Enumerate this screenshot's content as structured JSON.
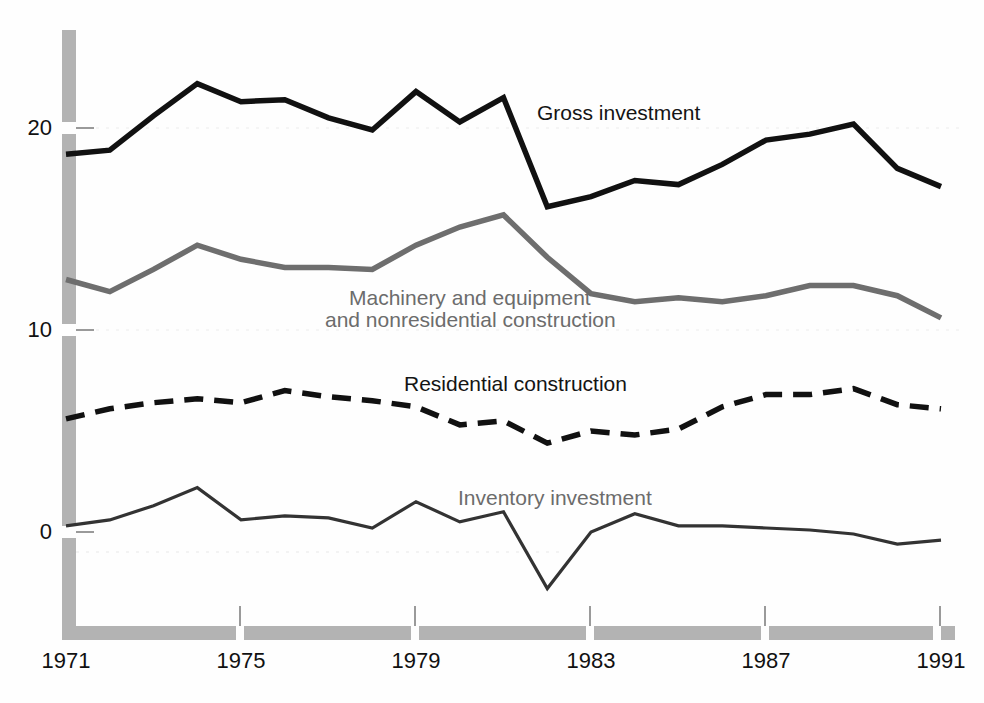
{
  "chart_data": {
    "type": "line",
    "title": "",
    "subtitle": "",
    "xlabel": "",
    "ylabel": "",
    "xlim": [
      1971,
      1991
    ],
    "ylim": [
      -5,
      24
    ],
    "grid": false,
    "legend_position": "inline-annotations",
    "x": [
      1971,
      1972,
      1973,
      1974,
      1975,
      1976,
      1977,
      1978,
      1979,
      1980,
      1981,
      1982,
      1983,
      1984,
      1985,
      1986,
      1987,
      1988,
      1989,
      1990,
      1991
    ],
    "x_tick_labels": [
      "1971",
      "1975",
      "1979",
      "1983",
      "1987",
      "1991"
    ],
    "x_ticks": [
      1971,
      1975,
      1979,
      1983,
      1987,
      1991
    ],
    "y_tick_labels": [
      "0",
      "10",
      "20"
    ],
    "y_ticks": [
      0,
      10,
      20
    ],
    "series": [
      {
        "name": "Gross investment",
        "color": "#111111",
        "style": "solid",
        "width": 5.5,
        "values": [
          18.7,
          18.9,
          20.6,
          22.2,
          21.3,
          21.4,
          20.5,
          19.9,
          21.8,
          20.3,
          21.5,
          16.1,
          16.6,
          17.4,
          17.2,
          18.2,
          19.4,
          19.7,
          20.2,
          18.0,
          17.1
        ]
      },
      {
        "name": "Machinery and equipment and nonresidential construction",
        "color": "#6e6e6e",
        "style": "solid",
        "width": 5.5,
        "values": [
          12.5,
          11.9,
          13.0,
          14.2,
          13.5,
          13.1,
          13.1,
          13.0,
          14.2,
          15.1,
          15.7,
          13.6,
          11.8,
          11.4,
          11.6,
          11.4,
          11.7,
          12.2,
          12.2,
          11.7,
          10.6
        ]
      },
      {
        "name": "Residential construction",
        "color": "#111111",
        "style": "dashed",
        "width": 5.5,
        "values": [
          5.6,
          6.1,
          6.4,
          6.6,
          6.4,
          7.0,
          6.7,
          6.5,
          6.2,
          5.3,
          5.5,
          4.4,
          5.0,
          4.8,
          5.1,
          6.2,
          6.8,
          6.8,
          7.1,
          6.3,
          6.1
        ]
      },
      {
        "name": "Inventory investment",
        "color": "#333333",
        "style": "solid",
        "width": 3.2,
        "values": [
          0.3,
          0.6,
          1.3,
          2.2,
          0.6,
          0.8,
          0.7,
          0.2,
          1.5,
          0.5,
          1.0,
          -2.8,
          0.0,
          0.9,
          0.3,
          0.3,
          0.2,
          0.1,
          -0.1,
          -0.6,
          -0.4
        ]
      }
    ],
    "annotations": [
      {
        "text": "Gross investment",
        "x_px": 537,
        "y_px": 100,
        "color": "#141414"
      },
      {
        "text": "Machinery and equipment",
        "x_px": 349,
        "y_px": 285,
        "color": "#6c6c6c"
      },
      {
        "text": "and nonresidential construction",
        "x_px": 325,
        "y_px": 307,
        "color": "#6c6c6c"
      },
      {
        "text": "Residential construction",
        "x_px": 404,
        "y_px": 371,
        "color": "#141414"
      },
      {
        "text": "Inventory investment",
        "x_px": 458,
        "y_px": 485,
        "color": "#6c6c6c"
      }
    ]
  },
  "axis": {
    "y_labels": [
      {
        "text": "20",
        "top_px": 115
      },
      {
        "text": "10",
        "top_px": 317
      },
      {
        "text": "0",
        "top_px": 519
      }
    ],
    "x_labels": [
      {
        "text": "1971",
        "left_px": 26
      },
      {
        "text": "1975",
        "left_px": 201
      },
      {
        "text": "1979",
        "left_px": 376
      },
      {
        "text": "1983",
        "left_px": 551
      },
      {
        "text": "1987",
        "left_px": 726
      },
      {
        "text": "1991",
        "left_px": 901
      }
    ],
    "spine_color": "#b3b3b3"
  }
}
